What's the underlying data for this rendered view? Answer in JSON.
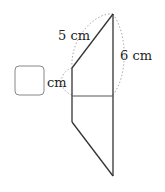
{
  "diagram": {
    "type": "geometry-figure",
    "labels": {
      "hypotenuse": "5 cm",
      "right_side": "6 cm",
      "unknown_unit": "cm"
    },
    "answer_box": {
      "value": ""
    },
    "colors": {
      "stroke": "#333333",
      "dotted_brace": "#aaaaaa",
      "box_border": "#888888"
    }
  }
}
